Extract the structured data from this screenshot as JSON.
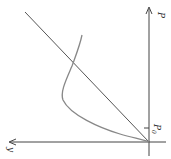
{
  "diagram": {
    "axes": {
      "vertical_label": "P",
      "horizontal_label": "y",
      "tick_label": "P",
      "tick_subscript": "0"
    },
    "colors": {
      "axis": "#444444",
      "line": "#555555",
      "curve": "#888888",
      "background": "#ffffff"
    }
  }
}
